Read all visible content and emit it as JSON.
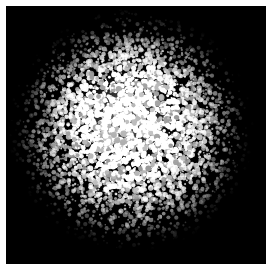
{
  "figure": {
    "domain": "natural-image",
    "kind": "thresholded-speckle-disc",
    "width_px": 269,
    "height_px": 271
  },
  "plate": {
    "background_color": "#000000",
    "margin_color": "#fdfdfd",
    "left_px": 6,
    "top_px": 6,
    "width_px": 260,
    "height_px": 258
  },
  "disc": {
    "center_x_px": 131,
    "center_y_px": 130,
    "radius_x_px": 123,
    "radius_y_px": 122,
    "shape": "ellipse",
    "edge": "ragged-speckled-falloff"
  },
  "core": {
    "center_x_px": 126,
    "center_y_px": 118,
    "radius_px": 52,
    "peak_color": "#f4f4f4",
    "label": "bright core"
  },
  "speckle": {
    "foreground_color": "#ffffff",
    "midtone_color": "#b8b8b8",
    "background_color": "#000000",
    "grain_count": 15000,
    "grain_min_px": 0.7,
    "grain_max_px": 2.9,
    "random_seed": 20240917,
    "core_fill_fraction": 0.82,
    "rim_fill_fraction": 0.05
  },
  "falloff": {
    "profile": "radial",
    "stops_pct": [
      0,
      18,
      34,
      50,
      64,
      78,
      90,
      100
    ],
    "density": [
      1.0,
      0.97,
      0.88,
      0.72,
      0.52,
      0.3,
      0.12,
      0.0
    ]
  },
  "colors": {
    "black": "#000000",
    "white": "#ffffff",
    "paper": "#fdfdfd",
    "gray_mid": "#9a9a9a"
  }
}
